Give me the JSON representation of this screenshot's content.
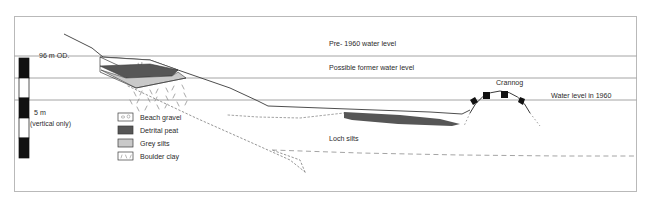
{
  "figure": {
    "type": "geological-cross-section",
    "title_visible": false,
    "frame": {
      "x": 14,
      "y": 16,
      "width": 623,
      "height": 176,
      "border_color": "#b9b9b9"
    }
  },
  "scale_bar": {
    "top_label": "96 m OD.",
    "unit_label": "5 m",
    "qualifier_label": "(vertical only)",
    "segments": [
      "black",
      "white",
      "black",
      "white",
      "black"
    ],
    "colors": {
      "fill": "#111111",
      "empty": "#ffffff",
      "stroke": "#111111"
    }
  },
  "water_levels": [
    {
      "id": "pre-1960",
      "label": "Pre- 1960 water level",
      "y": 56,
      "color": "#9a9a9a"
    },
    {
      "id": "possible-former",
      "label": "Possible former water level",
      "y": 78,
      "color": "#9a9a9a"
    },
    {
      "id": "water-1960",
      "label": "Water level in 1960",
      "y": 100,
      "color": "#9a9a9a"
    }
  ],
  "annotations": [
    {
      "id": "crannog",
      "label": "Crannog",
      "x": 500,
      "y": 84
    },
    {
      "id": "loch-silts",
      "label": "Loch silts",
      "x": 330,
      "y": 139
    }
  ],
  "legend": {
    "items": [
      {
        "label": "Beach gravel",
        "swatch": "gravel",
        "color": "#ffffff"
      },
      {
        "label": "Detrital peat",
        "swatch": "solid",
        "color": "#565656"
      },
      {
        "label": "Grey silts",
        "swatch": "solid",
        "color": "#c9c9c9"
      },
      {
        "label": "Boulder clay",
        "swatch": "clay",
        "color": "#ffffff"
      }
    ]
  },
  "palette": {
    "peat": "#565656",
    "silts": "#c9c9c9",
    "gravel": "#ffffff",
    "line": "#3a3a3a",
    "waterline": "#9a9a9a",
    "dashed": "#8a8a8a",
    "crannog_block": "#111111"
  }
}
